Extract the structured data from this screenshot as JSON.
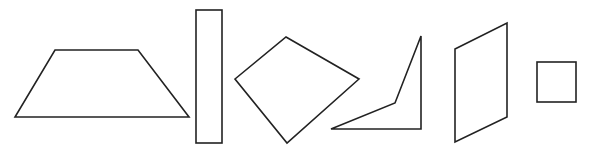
{
  "stroke_color": "#222222",
  "background": "#ffffff",
  "shapes": [
    {
      "id": "trapezoid",
      "label": "Trapezoid"
    },
    {
      "id": "tall-rectangle",
      "label": "Rectangle"
    },
    {
      "id": "kite",
      "label": "Quadrilateral"
    },
    {
      "id": "concave-quadrilateral",
      "label": "Concave quadrilateral"
    },
    {
      "id": "parallelogram",
      "label": "Parallelogram"
    },
    {
      "id": "square",
      "label": "Square"
    }
  ]
}
